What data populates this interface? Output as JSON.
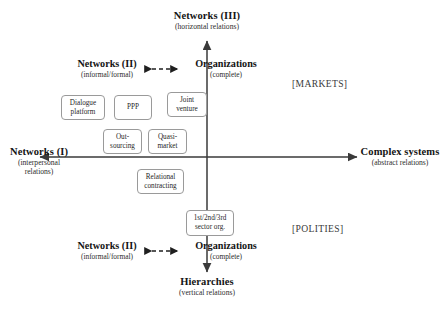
{
  "diagram": {
    "axes": {
      "top": {
        "title": "Networks (III)",
        "subtitle": "(horizontal relations)"
      },
      "bottom": {
        "title": "Hierarchies",
        "subtitle": "(vertical relations)"
      },
      "left": {
        "title": "Networks (I)",
        "subtitle": "(interpersonal relations)"
      },
      "right": {
        "title": "Complex systems",
        "subtitle": "(abstract relations)"
      }
    },
    "pairs": [
      {
        "left": {
          "title": "Networks (II)",
          "subtitle": "(informal/formal)"
        },
        "right": {
          "title": "Organizations",
          "subtitle": "(complete)"
        }
      },
      {
        "left": {
          "title": "Networks (II)",
          "subtitle": "(informal/formal)"
        },
        "right": {
          "title": "Organizations",
          "subtitle": "(complete)"
        }
      }
    ],
    "quadrants": [
      {
        "label": "[MARKETS]"
      },
      {
        "label": "[POLITIES]"
      }
    ],
    "nodes": [
      {
        "line1": "Dialogue",
        "line2": "platform"
      },
      {
        "line1": "PPP",
        "line2": ""
      },
      {
        "line1": "Joint",
        "line2": "venture"
      },
      {
        "line1": "Out-",
        "line2": "sourcing"
      },
      {
        "line1": "Quasi-",
        "line2": "market"
      },
      {
        "line1": "Relational",
        "line2": "contracting"
      },
      {
        "line1": "1st/2nd/3rd",
        "line2": "sector org."
      }
    ]
  }
}
